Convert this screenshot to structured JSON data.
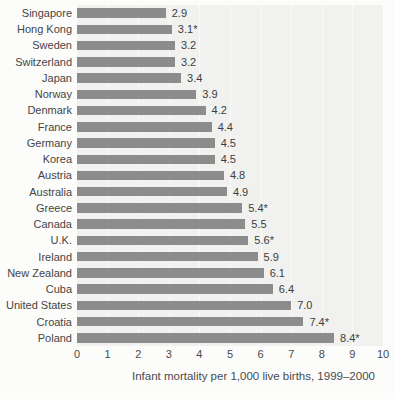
{
  "chart_data": {
    "type": "bar",
    "orientation": "horizontal",
    "title": "",
    "xlabel": "Infant mortality per 1,000 live births, 1999–2000",
    "xlim": [
      0,
      10
    ],
    "xticks": [
      "0",
      "1",
      "2",
      "3",
      "4",
      "5",
      "6",
      "7",
      "8",
      "9",
      "10"
    ],
    "categories": [
      "Singapore",
      "Hong Kong",
      "Sweden",
      "Switzerland",
      "Japan",
      "Norway",
      "Denmark",
      "France",
      "Germany",
      "Korea",
      "Austria",
      "Australia",
      "Greece",
      "Canada",
      "U.K.",
      "Ireland",
      "New Zealand",
      "Cuba",
      "United States",
      "Croatia",
      "Poland"
    ],
    "values": [
      2.9,
      3.1,
      3.2,
      3.2,
      3.4,
      3.9,
      4.2,
      4.4,
      4.5,
      4.5,
      4.8,
      4.9,
      5.4,
      5.5,
      5.6,
      5.9,
      6.1,
      6.4,
      7.0,
      7.4,
      8.4
    ],
    "value_labels": [
      "2.9",
      "3.1*",
      "3.2",
      "3.2",
      "3.4",
      "3.9",
      "4.2",
      "4.4",
      "4.5",
      "4.5",
      "4.8",
      "4.9",
      "5.4*",
      "5.5",
      "5.6*",
      "5.9",
      "6.1",
      "6.4",
      "7.0",
      "7.4*",
      "8.4*"
    ],
    "legend": null,
    "grid": "faint white vertical gridlines at each integer tick",
    "colors": {
      "bar": "#8c8c8c",
      "plot_background": "#f1f1ef",
      "page_background": "#fcfcfb",
      "category_text": "#454545",
      "value_text": "#3d3d3d",
      "tick_text": "#4a4a4a",
      "gridline": "rgba(255,255,255,0.65)"
    }
  }
}
